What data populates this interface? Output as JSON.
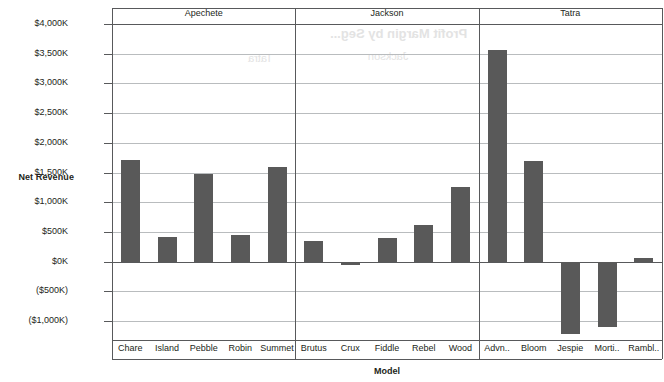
{
  "chart_data": {
    "type": "bar",
    "title": "",
    "xlabel": "Model",
    "ylabel": "Net Revenue",
    "ylim": [
      -1000,
      4000
    ],
    "yunit": "K",
    "ytick_labels": [
      "$4,000K",
      "$3,500K",
      "$3,000K",
      "$2,500K",
      "$2,000K",
      "$1,500K",
      "$1,000K",
      "$500K",
      "$0K",
      "($500K)",
      "($1,000K)"
    ],
    "ytick_values": [
      4000,
      3500,
      3000,
      2500,
      2000,
      1500,
      1000,
      500,
      0,
      -500,
      -1000
    ],
    "grid": true,
    "legend": "none",
    "bar_color": "#595959",
    "groups": [
      {
        "name": "Apechete",
        "categories": [
          "Chare",
          "Island",
          "Pebble",
          "Robin",
          "Summet"
        ],
        "values": [
          1718,
          420,
          1480,
          440,
          1600
        ]
      },
      {
        "name": "Jackson",
        "categories": [
          "Brutus",
          "Crux",
          "Fiddle",
          "Rebel",
          "Wood"
        ],
        "values": [
          350,
          -60,
          390,
          620,
          1262
        ]
      },
      {
        "name": "Tatra",
        "categories": [
          "Advn..",
          "Bloom",
          "Jespie",
          "Morti..",
          "Rambl.."
        ],
        "values": [
          3560,
          1700,
          -1212,
          -1095,
          60
        ]
      }
    ],
    "categories": [
      "Chare",
      "Island",
      "Pebble",
      "Robin",
      "Summet",
      "Brutus",
      "Crux",
      "Fiddle",
      "Rebel",
      "Wood",
      "Advn..",
      "Bloom",
      "Jespie",
      "Morti..",
      "Rambl.."
    ],
    "values": [
      1718,
      420,
      1480,
      440,
      1600,
      350,
      -60,
      390,
      620,
      1262,
      3560,
      1700,
      -1212,
      -1095,
      60
    ]
  },
  "ghost_text": {
    "title": "Profit Margin by Seg...",
    "jackson": "Jackson",
    "tatra": "Tatra"
  }
}
